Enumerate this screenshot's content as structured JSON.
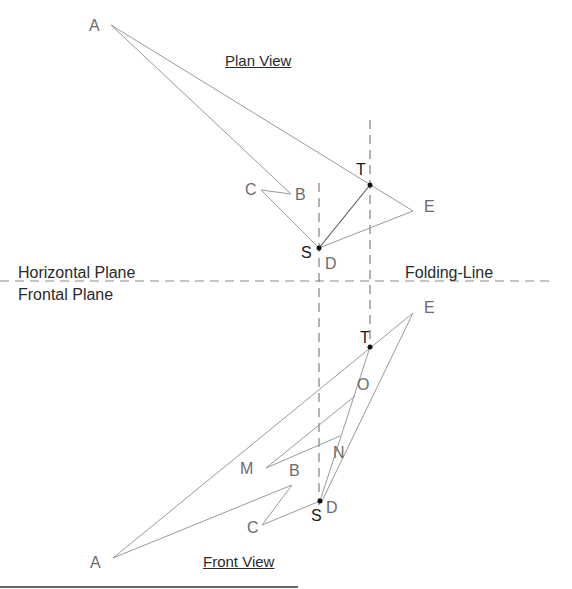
{
  "titles": {
    "plan_view": "Plan View",
    "front_view": "Front View"
  },
  "planes": {
    "horizontal": "Horizontal Plane",
    "frontal": "Frontal Plane",
    "folding_line": "Folding-Line"
  },
  "plan_points": {
    "A": "A",
    "B": "B",
    "C": "C",
    "D": "D",
    "E": "E",
    "S": "S",
    "T": "T"
  },
  "front_points": {
    "A": "A",
    "B": "B",
    "C": "C",
    "D": "D",
    "E": "E",
    "S": "S",
    "T": "T",
    "O": "O",
    "M": "M",
    "N": "N"
  },
  "colors": {
    "outline": "#9a9a9a",
    "projection": "#555555",
    "marker": "#111111"
  }
}
